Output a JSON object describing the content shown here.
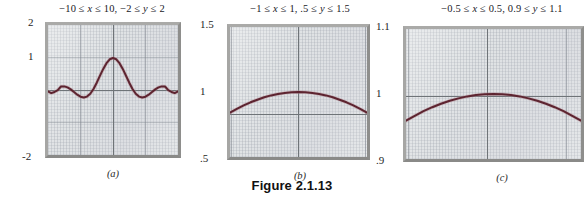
{
  "figure": {
    "label": "Figure 2.1.13"
  },
  "chart_data": [
    {
      "type": "line",
      "id": "panel-a",
      "title": "−10 ≤ x ≤ 10, −2 ≤ y ≤ 2",
      "caption": "(a)",
      "xlabel": "x",
      "ylabel": "y",
      "xlim": [
        -10,
        10
      ],
      "ylim": [
        -2,
        2
      ],
      "grid": true,
      "legend": null,
      "y_tick_labels": [
        "2",
        "1",
        "-2"
      ],
      "y_ticks": [
        2,
        1,
        -2
      ],
      "x_ticks": [
        -10,
        0,
        10
      ],
      "series": [
        {
          "name": "sin(x)/x",
          "x": [
            -10,
            -9.5,
            -9,
            -8.5,
            -8,
            -7.5,
            -7,
            -6.5,
            -6,
            -5.5,
            -5,
            -4.5,
            -4,
            -3.5,
            -3,
            -2.5,
            -2,
            -1.5,
            -1,
            -0.5,
            0,
            0.5,
            1,
            1.5,
            2,
            2.5,
            3,
            3.5,
            4,
            4.5,
            5,
            5.5,
            6,
            6.5,
            7,
            7.5,
            8,
            8.5,
            9,
            9.5,
            10
          ],
          "y": [
            -0.054,
            -0.079,
            -0.046,
            0.009,
            0.124,
            0.125,
            0.094,
            0.033,
            -0.047,
            -0.128,
            -0.192,
            -0.217,
            -0.189,
            -0.1,
            0.047,
            0.239,
            0.455,
            0.665,
            0.841,
            0.959,
            1.0,
            0.959,
            0.841,
            0.665,
            0.455,
            0.239,
            0.047,
            -0.1,
            -0.189,
            -0.217,
            -0.192,
            -0.128,
            -0.047,
            0.033,
            0.094,
            0.125,
            0.124,
            0.009,
            -0.046,
            -0.079,
            -0.054
          ]
        }
      ]
    },
    {
      "type": "line",
      "id": "panel-b",
      "title": "−1 ≤ x ≤ 1, .5 ≤ y ≤ 1.5",
      "caption": "(b)",
      "xlabel": "x",
      "ylabel": "y",
      "xlim": [
        -1,
        1
      ],
      "ylim": [
        0.5,
        1.5
      ],
      "grid": true,
      "legend": null,
      "y_tick_labels": [
        "1.5",
        "1",
        ".5"
      ],
      "y_ticks": [
        1.5,
        1,
        0.5
      ],
      "x_ticks": [
        -1,
        0,
        1
      ],
      "series": [
        {
          "name": "sin(x)/x",
          "x": [
            -1,
            -0.9,
            -0.8,
            -0.7,
            -0.6,
            -0.5,
            -0.4,
            -0.3,
            -0.2,
            -0.1,
            0,
            0.1,
            0.2,
            0.3,
            0.4,
            0.5,
            0.6,
            0.7,
            0.8,
            0.9,
            1
          ],
          "y": [
            0.841,
            0.87,
            0.897,
            0.921,
            0.941,
            0.959,
            0.974,
            0.985,
            0.993,
            0.998,
            1.0,
            0.998,
            0.993,
            0.985,
            0.974,
            0.959,
            0.941,
            0.921,
            0.897,
            0.87,
            0.841
          ]
        }
      ]
    },
    {
      "type": "line",
      "id": "panel-c",
      "title": "−0.5 ≤ x ≤ 0.5, 0.9 ≤ y ≤ 1.1",
      "caption": "(c)",
      "xlabel": "x",
      "ylabel": "y",
      "xlim": [
        -0.5,
        0.5
      ],
      "ylim": [
        0.9,
        1.1
      ],
      "grid": true,
      "legend": null,
      "y_tick_labels": [
        "1.1",
        "1",
        ".9"
      ],
      "y_ticks": [
        1.1,
        1,
        0.9
      ],
      "x_ticks": [
        -0.5,
        0,
        0.5
      ],
      "series": [
        {
          "name": "sin(x)/x",
          "x": [
            -0.5,
            -0.45,
            -0.4,
            -0.35,
            -0.3,
            -0.25,
            -0.2,
            -0.15,
            -0.1,
            -0.05,
            0,
            0.05,
            0.1,
            0.15,
            0.2,
            0.25,
            0.3,
            0.35,
            0.4,
            0.45,
            0.5
          ],
          "y": [
            0.9589,
            0.9664,
            0.9735,
            0.9797,
            0.9851,
            0.9896,
            0.9933,
            0.9963,
            0.9983,
            0.9996,
            1.0,
            0.9996,
            0.9983,
            0.9963,
            0.9933,
            0.9896,
            0.9851,
            0.9797,
            0.9735,
            0.9664,
            0.9589
          ]
        }
      ]
    }
  ]
}
